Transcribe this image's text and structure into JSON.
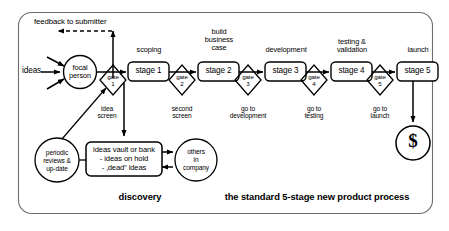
{
  "diagram": {
    "frame": {
      "stroke": "#6d6d6d"
    },
    "ink": "#000000",
    "feedback_label": "feedback to submitter",
    "ideas_label": "ideas",
    "focal_person": {
      "line1": "focal",
      "line2": "person"
    },
    "money_symbol": "$",
    "stages": [
      {
        "id": "stage-1",
        "box_label": "stage 1",
        "caption": "scoping",
        "caption_lines": [
          "scoping"
        ]
      },
      {
        "id": "stage-2",
        "box_label": "stage 2",
        "caption": "build business case",
        "caption_lines": [
          "build",
          "business",
          "case"
        ]
      },
      {
        "id": "stage-3",
        "box_label": "stage 3",
        "caption": "development",
        "caption_lines": [
          "development"
        ]
      },
      {
        "id": "stage-4",
        "box_label": "stage 4",
        "caption": "testing & validation",
        "caption_lines": [
          "testing &",
          "validation"
        ]
      },
      {
        "id": "stage-5",
        "box_label": "stage 5",
        "caption": "launch",
        "caption_lines": [
          "launch"
        ]
      }
    ],
    "gates": [
      {
        "id": "gate-1",
        "word": "gate",
        "number": "1",
        "sub_lines": [
          "idea",
          "screen"
        ]
      },
      {
        "id": "gate-2",
        "word": "gate",
        "number": "2",
        "sub_lines": [
          "second",
          "screen"
        ]
      },
      {
        "id": "gate-3",
        "word": "gate",
        "number": "3",
        "sub_lines": [
          "go to",
          "development"
        ]
      },
      {
        "id": "gate-4",
        "word": "gate",
        "number": "4",
        "sub_lines": [
          "go to",
          "testing"
        ]
      },
      {
        "id": "gate-5",
        "word": "gate",
        "number": "5",
        "sub_lines": [
          "go to",
          "launch"
        ]
      }
    ],
    "discovery": {
      "periodic_reviews_lines": [
        "periodic",
        "reviews &",
        "up-date"
      ],
      "vault_lines": [
        "ideas vault or bank",
        "- ideas on hold",
        "- ‚dead“ ideas"
      ],
      "others_lines": [
        "others",
        "in",
        "company"
      ]
    },
    "footers": [
      {
        "id": "footer-discovery",
        "label": "discovery"
      },
      {
        "id": "footer-process",
        "label": "the standard 5-stage new product process"
      }
    ]
  }
}
